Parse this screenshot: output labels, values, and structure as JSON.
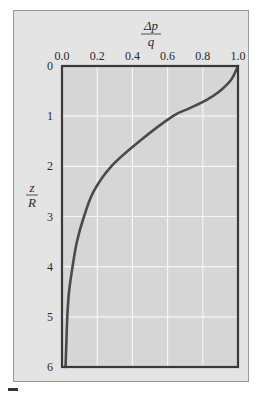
{
  "chart_data": {
    "type": "line",
    "title": "",
    "xlabel": {
      "numerator": "Δp",
      "denominator": "q"
    },
    "ylabel": {
      "numerator": "z",
      "denominator": "R"
    },
    "xlim": [
      0.0,
      1.0
    ],
    "ylim": [
      0,
      6
    ],
    "y_inverted": true,
    "x_axis_position": "top",
    "grid": true,
    "x_ticks": [
      "0.0",
      "0.2",
      "0.4",
      "0.6",
      "0.8",
      "1.0"
    ],
    "y_ticks": [
      "0",
      "1",
      "2",
      "3",
      "4",
      "5",
      "6"
    ],
    "series": [
      {
        "name": "stress distribution",
        "color": "#4a4a4a",
        "points": [
          {
            "x": 1.0,
            "z": 0.0
          },
          {
            "x": 0.96,
            "z": 0.28
          },
          {
            "x": 0.89,
            "z": 0.52
          },
          {
            "x": 0.82,
            "z": 0.68
          },
          {
            "x": 0.72,
            "z": 0.85
          },
          {
            "x": 0.63,
            "z": 1.0
          },
          {
            "x": 0.44,
            "z": 1.5
          },
          {
            "x": 0.28,
            "z": 2.0
          },
          {
            "x": 0.18,
            "z": 2.5
          },
          {
            "x": 0.125,
            "z": 3.0
          },
          {
            "x": 0.085,
            "z": 3.5
          },
          {
            "x": 0.06,
            "z": 4.0
          },
          {
            "x": 0.04,
            "z": 4.5
          },
          {
            "x": 0.03,
            "z": 5.0
          },
          {
            "x": 0.025,
            "z": 5.5
          },
          {
            "x": 0.02,
            "z": 6.0
          }
        ]
      }
    ]
  },
  "colors": {
    "plot_bg": "#d6d6d6",
    "card_bg": "#e4e4e4",
    "frame": "#3a3a3a",
    "grid": "#f6f6f6",
    "curve": "#4a4a4a"
  }
}
